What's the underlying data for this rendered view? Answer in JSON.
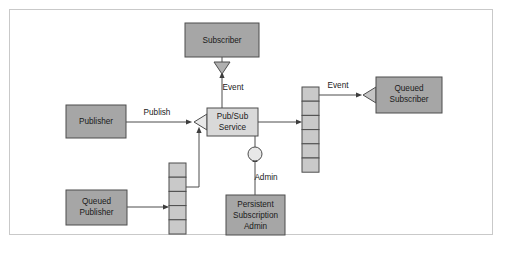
{
  "figure": {
    "caption": "",
    "frame_color": "#c9c9c9",
    "background": "#ffffff"
  },
  "colors": {
    "node_fill_dark": "#a6a6a6",
    "node_fill_light": "#d9d9d9",
    "queue_fill": "#c9c9c9",
    "stroke": "#4d4d4d",
    "text": "#1a1a1a"
  },
  "nodes": {
    "subscriber": {
      "label": "Subscriber",
      "fill": "#a6a6a6"
    },
    "publisher": {
      "label": "Publisher",
      "fill": "#a6a6a6"
    },
    "queued_publisher": {
      "label_line1": "Queued",
      "label_line2": "Publisher",
      "fill": "#a6a6a6"
    },
    "pubsub_service": {
      "label_line1": "Pub/Sub",
      "label_line2": "Service",
      "fill": "#d9d9d9"
    },
    "queued_subscriber": {
      "label_line1": "Queued",
      "label_line2": "Subscriber",
      "fill": "#a6a6a6"
    },
    "persistent_subscription_admin": {
      "label_line1": "Persistent",
      "label_line2": "Subscription",
      "label_line3": "Admin",
      "fill": "#a6a6a6"
    }
  },
  "queues": {
    "publisher_queue": {
      "cells": 6,
      "fill": "#c9c9c9"
    },
    "subscriber_queue": {
      "cells": 6,
      "fill": "#c9c9c9"
    }
  },
  "edge_labels": {
    "publish": "Publish",
    "event_subscriber": "Event",
    "event_queued_subscriber": "Event",
    "admin": "Admin"
  }
}
